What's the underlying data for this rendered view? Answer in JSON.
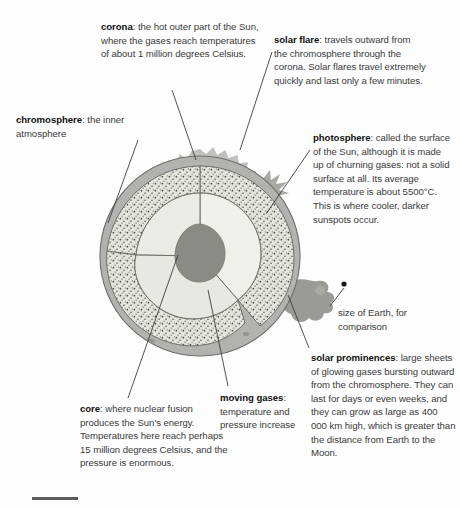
{
  "figure": {
    "type": "cutaway cross-section diagram"
  },
  "callouts": {
    "corona": {
      "term": "corona",
      "body": ": the hot outer part of the Sun, where the gases reach temperatures of about 1 million degrees Celsius."
    },
    "solar_flare": {
      "term": "solar flare",
      "body": ": travels outward from the chromosphere through the corona. Solar flares travel extremely quickly and last only a few minutes."
    },
    "chromosphere": {
      "term": "chromosphere",
      "body": ": the inner atmosphere"
    },
    "photosphere": {
      "term": "photosphere",
      "body": ": called the surface of the Sun, although it is made up of churning gases: not a solid surface at all. Its average temperature is about 5500°C. This is where cooler, darker sunspots occur."
    },
    "earth_size": {
      "term": "",
      "body": "size of Earth, for comparison"
    },
    "solar_prominences": {
      "term": "solar prominences",
      "body": ": large sheets of glowing gases bursting outward from the chromosphere. They can last for days or even weeks, and they can grow as large as 400 000 km high, which is greater than the distance from Earth to the Moon."
    },
    "core": {
      "term": "core",
      "body": ": where nuclear fusion produces the Sun's energy. Temperatures here reach perhaps 15 million degrees Celsius, and the pressure is enormous."
    },
    "moving_gases": {
      "term": "moving gases",
      "body": ": temperature and pressure increase"
    }
  },
  "facts": {
    "corona_temperature": "1 million degrees Celsius",
    "photosphere_temperature": "5500°C",
    "core_temperature": "15 million degrees Celsius",
    "prominence_height": "400 000 km"
  },
  "colors": {
    "page_background": "#fdfdfd",
    "photosphere_fill": "#b2b2b0",
    "corona_fill": "#bdbdbb",
    "convection_fill": "#e2e2dd",
    "radiative_fill": "#ededea",
    "core_fill": "#8a8a86",
    "prominence_fill": "#9a9a97",
    "outline": "#6e6e6b",
    "leader_line": "#3d3d3d",
    "text": "#333131",
    "term_text": "#111111",
    "footer_rule": "#5c5c5c",
    "earth_dot": "#1a1a1a"
  },
  "labels": {
    "earth_dot": "size-of-earth-dot",
    "sun": "sun-cutaway-illustration"
  }
}
